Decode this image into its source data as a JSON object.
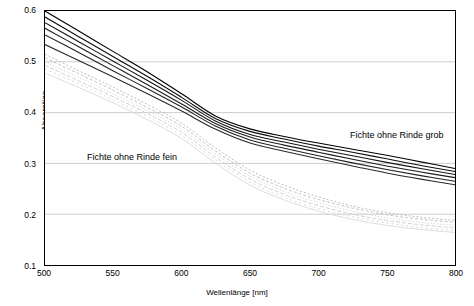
{
  "chart_data": {
    "type": "line",
    "title": "",
    "xlabel": "Wellenlänge  [nm]",
    "ylabel": "Absorption",
    "xlim": [
      500,
      800
    ],
    "ylim": [
      0.1,
      0.6
    ],
    "xticks": [
      500,
      550,
      600,
      650,
      700,
      750,
      800
    ],
    "xtick_labels": [
      "500",
      "550",
      "600",
      "650",
      "700",
      "750",
      "800"
    ],
    "yticks": [
      0.1,
      0.2,
      0.3,
      0.4,
      0.5,
      0.6
    ],
    "ytick_labels": [
      "0.1",
      "0.2",
      "0.3",
      "0.4",
      "0.5",
      "0.6"
    ],
    "grid": "horizontal",
    "legend": "none",
    "annotations": [
      {
        "id": "fein",
        "text": "Fichte ohne Rinde fein",
        "x": 512,
        "y": 0.295
      },
      {
        "id": "grob",
        "text": "Fichte ohne Rinde grob",
        "x": 700,
        "y": 0.337
      }
    ],
    "x": [
      500,
      525,
      550,
      575,
      600,
      625,
      650,
      675,
      700,
      725,
      750,
      775,
      800
    ],
    "series": [
      {
        "name": "grob-1",
        "color": "#000000",
        "width": 1.1,
        "dash": "none",
        "values": [
          0.6,
          0.56,
          0.52,
          0.48,
          0.437,
          0.393,
          0.368,
          0.353,
          0.34,
          0.328,
          0.316,
          0.303,
          0.29
        ]
      },
      {
        "name": "grob-2",
        "color": "#0d0d0d",
        "width": 1.1,
        "dash": "none",
        "values": [
          0.588,
          0.549,
          0.51,
          0.471,
          0.43,
          0.388,
          0.363,
          0.348,
          0.334,
          0.322,
          0.309,
          0.296,
          0.284
        ]
      },
      {
        "name": "grob-3",
        "color": "#151515",
        "width": 1.1,
        "dash": "none",
        "values": [
          0.577,
          0.539,
          0.501,
          0.463,
          0.424,
          0.383,
          0.357,
          0.342,
          0.328,
          0.315,
          0.302,
          0.29,
          0.278
        ]
      },
      {
        "name": "grob-4",
        "color": "#1c1c1c",
        "width": 1.1,
        "dash": "none",
        "values": [
          0.566,
          0.529,
          0.492,
          0.455,
          0.417,
          0.378,
          0.352,
          0.336,
          0.322,
          0.308,
          0.295,
          0.283,
          0.272
        ]
      },
      {
        "name": "grob-5",
        "color": "#222222",
        "width": 1.1,
        "dash": "none",
        "values": [
          0.553,
          0.518,
          0.482,
          0.447,
          0.411,
          0.373,
          0.346,
          0.33,
          0.315,
          0.301,
          0.288,
          0.276,
          0.265
        ]
      },
      {
        "name": "grob-6",
        "color": "#2a2a2a",
        "width": 1.1,
        "dash": "none",
        "values": [
          0.534,
          0.502,
          0.47,
          0.437,
          0.403,
          0.367,
          0.34,
          0.324,
          0.309,
          0.295,
          0.281,
          0.269,
          0.258
        ]
      },
      {
        "name": "fein-1",
        "color": "#b5b5b5",
        "width": 0.9,
        "dash": "2,2",
        "values": [
          0.515,
          0.482,
          0.45,
          0.416,
          0.379,
          0.33,
          0.287,
          0.257,
          0.234,
          0.216,
          0.203,
          0.194,
          0.188
        ]
      },
      {
        "name": "fein-2",
        "color": "#bdbdbd",
        "width": 0.9,
        "dash": "3,2",
        "values": [
          0.508,
          0.476,
          0.444,
          0.41,
          0.373,
          0.324,
          0.281,
          0.251,
          0.229,
          0.212,
          0.199,
          0.19,
          0.184
        ]
      },
      {
        "name": "fein-3",
        "color": "#c4c4c4",
        "width": 0.9,
        "dash": "1,2",
        "values": [
          0.5,
          0.469,
          0.437,
          0.404,
          0.367,
          0.318,
          0.275,
          0.245,
          0.223,
          0.206,
          0.193,
          0.184,
          0.178
        ]
      },
      {
        "name": "fein-4",
        "color": "#cbcbcb",
        "width": 0.9,
        "dash": "4,2",
        "values": [
          0.493,
          0.462,
          0.431,
          0.398,
          0.361,
          0.312,
          0.269,
          0.239,
          0.217,
          0.2,
          0.188,
          0.179,
          0.173
        ]
      },
      {
        "name": "fein-5",
        "color": "#d2d2d2",
        "width": 0.9,
        "dash": "2,3",
        "values": [
          0.486,
          0.456,
          0.425,
          0.392,
          0.355,
          0.306,
          0.263,
          0.233,
          0.211,
          0.195,
          0.183,
          0.174,
          0.168
        ]
      },
      {
        "name": "fein-6",
        "color": "#d9d9d9",
        "width": 0.9,
        "dash": "none",
        "values": [
          0.478,
          0.449,
          0.419,
          0.386,
          0.349,
          0.3,
          0.257,
          0.228,
          0.206,
          0.19,
          0.178,
          0.17,
          0.164
        ]
      }
    ]
  }
}
